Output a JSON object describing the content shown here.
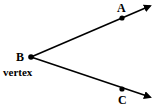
{
  "diagram": {
    "type": "angle",
    "vertex": {
      "label": "B",
      "caption": "vertex"
    },
    "rays": [
      {
        "point_label": "A",
        "direction": "upper-right"
      },
      {
        "point_label": "C",
        "direction": "lower-right"
      }
    ],
    "colors": {
      "stroke": "#000000",
      "background": "#ffffff"
    }
  }
}
